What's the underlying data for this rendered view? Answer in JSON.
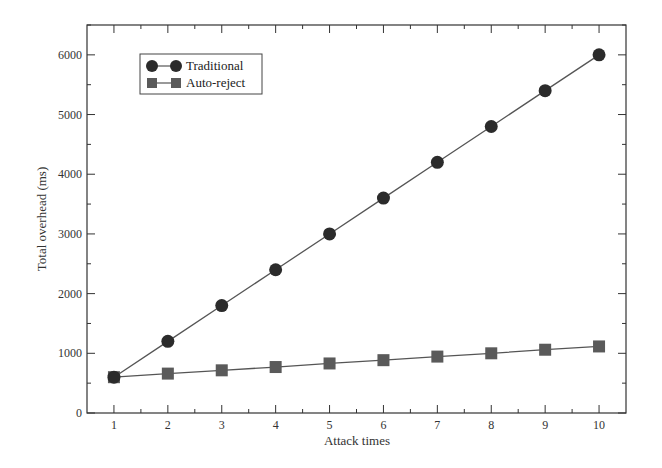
{
  "chart_data": {
    "type": "line",
    "title": "",
    "xlabel": "Attack times",
    "ylabel": "Total overhead (ms)",
    "x": [
      1,
      2,
      3,
      4,
      5,
      6,
      7,
      8,
      9,
      10
    ],
    "xlim": [
      0.5,
      10.5
    ],
    "ylim": [
      0,
      6500
    ],
    "xticks": [
      1,
      2,
      3,
      4,
      5,
      6,
      7,
      8,
      9,
      10
    ],
    "yticks": [
      0,
      1000,
      2000,
      3000,
      4000,
      5000,
      6000
    ],
    "grid": false,
    "legend_position": "upper left",
    "series": [
      {
        "name": "Traditional",
        "marker": "circle",
        "color": "#2b2b2b",
        "values": [
          600,
          1200,
          1800,
          2400,
          3000,
          3600,
          4200,
          4800,
          5400,
          6000
        ]
      },
      {
        "name": "Auto-reject",
        "marker": "square",
        "color": "#5a5a5a",
        "values": [
          600,
          660,
          715,
          770,
          830,
          885,
          945,
          1000,
          1060,
          1115
        ]
      }
    ]
  },
  "colors": {
    "axis": "#333333",
    "line": "#555555"
  }
}
